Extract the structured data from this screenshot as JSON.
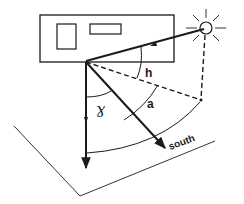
{
  "diagram": {
    "labels": {
      "altitude": "h",
      "azimuth": "a",
      "wall_solar_azimuth": "ɣ",
      "south": "south"
    },
    "elements": {
      "building_facade": "rectangle with two windows",
      "sun": "circle with rays",
      "sun_ray": "arrow from sun to wall base",
      "sun_projection": "dashed lines from sun to ground and ground to wall base",
      "wall_normal": "arrow perpendicular to wall",
      "south_direction": "arrow toward south",
      "ground_plane": "parallelogram"
    },
    "colors": {
      "stroke": "#1a1a1a",
      "background": "#ffffff"
    }
  }
}
